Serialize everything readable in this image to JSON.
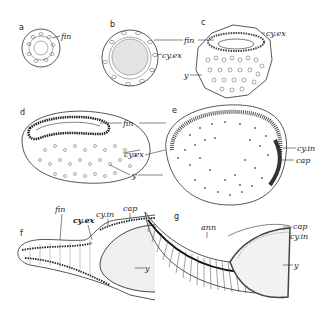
{
  "figure": {
    "panels": [
      {
        "id": "a",
        "label": "a",
        "labels": [
          "fin"
        ]
      },
      {
        "id": "b",
        "label": "b",
        "labels": [
          "fin",
          "cy.ex"
        ]
      },
      {
        "id": "c",
        "label": "c",
        "labels": [
          "cy.ex",
          "y"
        ]
      },
      {
        "id": "d",
        "label": "d",
        "labels": [
          "fin",
          "cy.ex",
          "y"
        ]
      },
      {
        "id": "e",
        "label": "e",
        "labels": [
          "cy.in",
          "cap"
        ]
      },
      {
        "id": "f",
        "label": "f",
        "labels": [
          "fin",
          "cy.ex",
          "cy.in",
          "cap",
          "y"
        ]
      },
      {
        "id": "g",
        "label": "g",
        "labels": [
          "ann",
          "cap",
          "cy.in",
          "y"
        ]
      }
    ],
    "text": {
      "a": "a",
      "b": "b",
      "c": "c",
      "d": "d",
      "e": "e",
      "f": "f",
      "g": "g",
      "fin": "fin",
      "cy_ex": "cy.ex",
      "cy_in": "cy.in",
      "cap": "cap",
      "y": "y",
      "ann": "ann"
    }
  }
}
